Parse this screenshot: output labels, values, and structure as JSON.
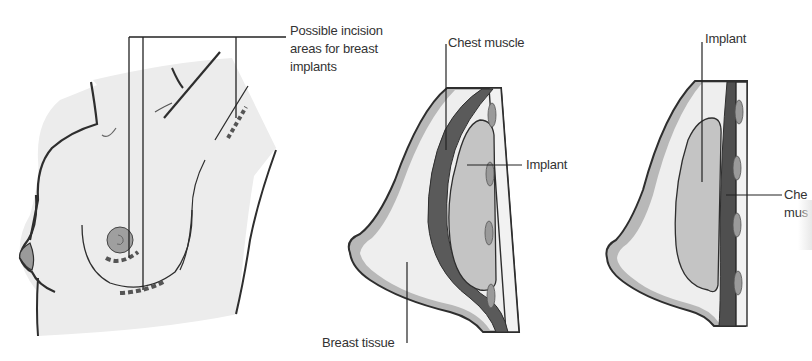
{
  "figure": {
    "panels": [
      {
        "id": "side-view",
        "description": "Side view of female torso showing possible incision sites",
        "labels": [
          {
            "key": "incision_areas",
            "lines": [
              "Possible incision",
              "areas for breast",
              "implants"
            ]
          }
        ]
      },
      {
        "id": "submuscular",
        "description": "Cross-section with implant placed behind chest muscle",
        "labels": [
          {
            "key": "chest_muscle",
            "text": "Chest muscle"
          },
          {
            "key": "implant",
            "text": "Implant"
          },
          {
            "key": "breast_tissue",
            "text": "Breast tissue"
          }
        ]
      },
      {
        "id": "subglandular",
        "description": "Cross-section with implant placed in front of chest muscle",
        "labels": [
          {
            "key": "implant",
            "text": "Implant"
          },
          {
            "key": "chest_muscle",
            "lines": [
              "Che",
              "mus"
            ]
          }
        ]
      }
    ],
    "colors": {
      "skin_fill": "#ececec",
      "outline": "#2e2e2e",
      "fat_layer": "#b8b8b8",
      "breast_tissue": "#eeeeee",
      "muscle": "#5a5a5a",
      "implant": "#c4c4c4",
      "rib": "#9a9a9a",
      "text": "#333333"
    }
  }
}
